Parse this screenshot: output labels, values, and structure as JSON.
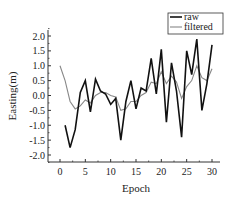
{
  "chart_data": {
    "type": "line",
    "title": "",
    "xlabel": "Epoch",
    "ylabel": "Easting(m)",
    "xlim": [
      -1.5,
      31.5
    ],
    "ylim": [
      -2.3,
      2.3
    ],
    "xticks": [
      0,
      5,
      10,
      15,
      20,
      25,
      30
    ],
    "yticks": [
      2.0,
      1.5,
      1.0,
      0.5,
      0.0,
      -0.5,
      -1.0,
      -1.5,
      -2.0
    ],
    "ytick_labels": [
      "2.0",
      "1.5",
      "1.0",
      "0.5",
      "0.0",
      "-0.5",
      "-1.0",
      "-1.5",
      "-2.0"
    ],
    "xtick_labels": [
      "0",
      "5",
      "10",
      "15",
      "20",
      "25",
      "30"
    ],
    "grid": false,
    "legend_position": "upper right",
    "series": [
      {
        "name": "raw",
        "color": "#111111",
        "x": [
          1,
          2,
          3,
          4,
          5,
          6,
          7,
          8,
          9,
          10,
          11,
          12,
          13,
          14,
          15,
          16,
          17,
          18,
          19,
          20,
          21,
          22,
          23,
          24,
          25,
          26,
          27,
          28,
          29,
          30
        ],
        "values": [
          -1.0,
          -1.75,
          -1.15,
          0.1,
          0.5,
          -0.55,
          0.55,
          0.15,
          0.05,
          -0.3,
          -0.1,
          -1.5,
          -0.2,
          0.5,
          -0.45,
          0.25,
          0.15,
          1.25,
          0.05,
          1.55,
          -0.9,
          1.1,
          0.15,
          -1.4,
          1.5,
          0.7,
          1.9,
          -0.5,
          0.4,
          1.7
        ]
      },
      {
        "name": "filtered",
        "color": "#888888",
        "x": [
          0,
          1,
          2,
          3,
          4,
          5,
          6,
          7,
          8,
          9,
          10,
          11,
          12,
          13,
          14,
          15,
          16,
          17,
          18,
          19,
          20,
          21,
          22,
          23,
          24,
          25,
          26,
          27,
          28,
          29,
          30
        ],
        "values": [
          1.0,
          0.5,
          -0.2,
          -0.45,
          -0.35,
          -0.15,
          -0.25,
          0.0,
          0.1,
          0.1,
          0.0,
          -0.05,
          -0.5,
          -0.45,
          -0.2,
          -0.2,
          0.0,
          0.1,
          0.45,
          0.4,
          0.8,
          0.4,
          0.65,
          0.45,
          -0.1,
          0.3,
          0.5,
          1.0,
          0.6,
          0.5,
          0.9
        ]
      }
    ]
  }
}
